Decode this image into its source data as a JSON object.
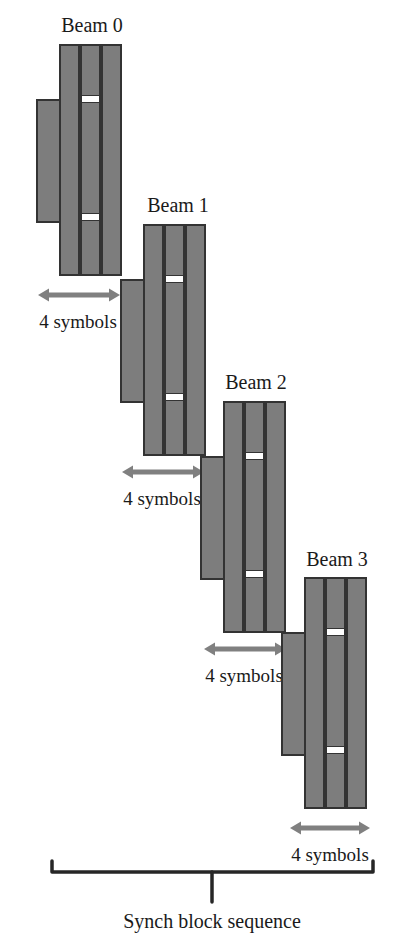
{
  "figure": {
    "type": "timing-diagram",
    "caption": "Synch block sequence",
    "colors": {
      "bar_fill": "#7d7d7d",
      "bar_stroke": "#333333",
      "gap_fill": "#ffffff",
      "arrow": "#808080",
      "bracket": "#262626",
      "text": "#1a1a1a",
      "background": "#ffffff"
    },
    "geometry": {
      "bar_width": 19,
      "bar_gap": 2,
      "main_bar_height": 230,
      "side_bar_width": 23,
      "side_bar_height": 122,
      "gap_height": 7,
      "gap1_offset": 50,
      "gap2_offset": 168
    },
    "beams": [
      {
        "label": "Beam 0",
        "label_x": 92,
        "label_y": 32,
        "main_x": 60,
        "main_y": 45,
        "side_x": 37,
        "side_y": 100,
        "arrow": {
          "label": "4 symbols",
          "x1": 38,
          "x2": 120,
          "y": 295,
          "label_x": 78,
          "label_y": 328
        }
      },
      {
        "label": "Beam 1",
        "label_x": 178,
        "label_y": 212,
        "main_x": 144,
        "main_y": 225,
        "side_x": 121,
        "side_y": 280,
        "arrow": {
          "label": "4 symbols",
          "x1": 122,
          "x2": 204,
          "y": 472,
          "label_x": 162,
          "label_y": 505
        }
      },
      {
        "label": "Beam 2",
        "label_x": 256,
        "label_y": 389,
        "main_x": 224,
        "main_y": 402,
        "side_x": 201,
        "side_y": 457,
        "arrow": {
          "label": "4 symbols",
          "x1": 204,
          "x2": 286,
          "y": 649,
          "label_x": 244,
          "label_y": 682
        }
      },
      {
        "label": "Beam 3",
        "label_x": 337,
        "label_y": 566,
        "main_x": 305,
        "main_y": 578,
        "side_x": 282,
        "side_y": 633,
        "arrow": {
          "label": "4 symbols",
          "x1": 290,
          "x2": 370,
          "y": 828,
          "label_x": 330,
          "label_y": 861
        }
      }
    ],
    "bracket": {
      "left_x": 52,
      "right_x": 373,
      "y": 872,
      "tip_y": 861,
      "center_x": 212,
      "stem_y": 902,
      "caption_x": 212,
      "caption_y": 928
    }
  }
}
